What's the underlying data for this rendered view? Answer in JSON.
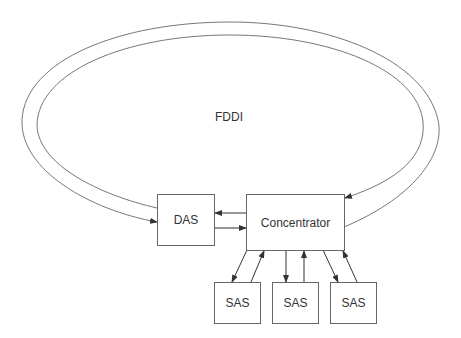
{
  "diagram": {
    "ring_label": "FDDI",
    "nodes": {
      "das": "DAS",
      "concentrator": "Concentrator",
      "sas": [
        "SAS",
        "SAS",
        "SAS"
      ]
    },
    "edges": [
      {
        "from": "FDDI ring (outer)",
        "to": "DAS"
      },
      {
        "from": "FDDI ring (inner)",
        "to": "Concentrator"
      },
      {
        "from": "Concentrator",
        "to": "DAS"
      },
      {
        "from": "DAS",
        "to": "Concentrator"
      },
      {
        "from": "Concentrator",
        "to": "SAS 1"
      },
      {
        "from": "SAS 1",
        "to": "Concentrator"
      },
      {
        "from": "Concentrator",
        "to": "SAS 2"
      },
      {
        "from": "SAS 2",
        "to": "Concentrator"
      },
      {
        "from": "Concentrator",
        "to": "SAS 3"
      },
      {
        "from": "SAS 3",
        "to": "Concentrator"
      }
    ]
  }
}
